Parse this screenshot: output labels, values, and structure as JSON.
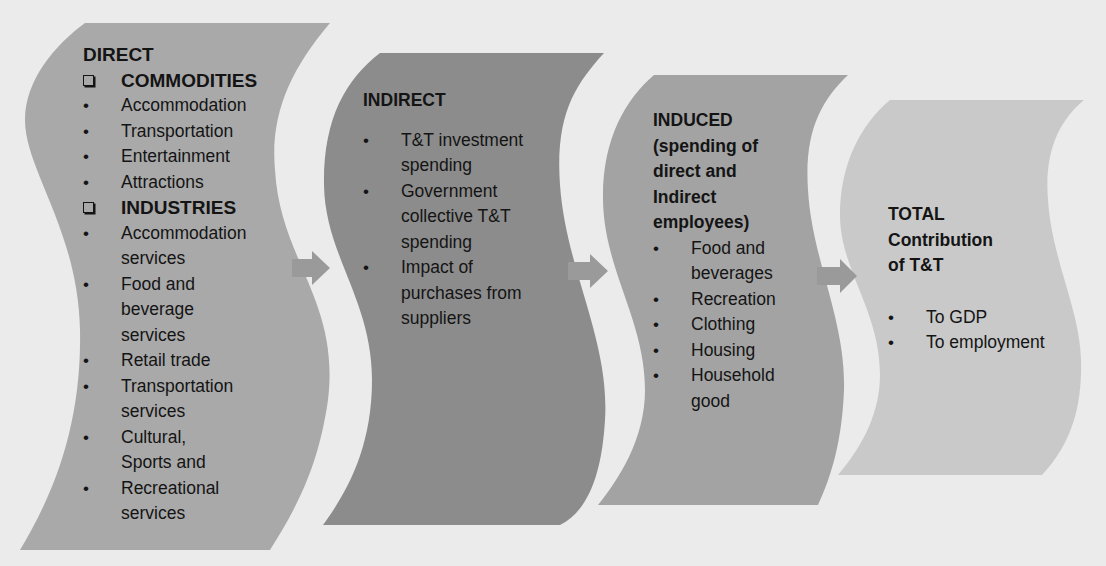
{
  "colors": {
    "background": "#ebebeb",
    "direct_fill": "#a9a9a9",
    "indirect_fill": "#8c8c8c",
    "induced_fill": "#a3a3a3",
    "total_fill": "#c9c9c9",
    "arrow_fill": "#9a9a9a",
    "text": "#141414"
  },
  "panels": {
    "direct": {
      "title": "DIRECT",
      "groups": [
        {
          "heading": "COMMODITIES",
          "icon": "checkbox-square-icon",
          "items": [
            "Accommodation",
            "Transportation",
            "Entertainment",
            "Attractions"
          ]
        },
        {
          "heading": "INDUSTRIES",
          "icon": "checkbox-square-icon",
          "items": [
            "Accommodation services",
            "Food and beverage services",
            "Retail trade",
            "Transportation services",
            "Cultural, Sports and",
            "Recreational services"
          ]
        }
      ]
    },
    "indirect": {
      "title": "INDIRECT",
      "items": [
        "T&T investment spending",
        "Government collective T&T spending",
        "Impact of purchases from suppliers"
      ]
    },
    "induced": {
      "title": "INDUCED (spending of direct and Indirect employees)",
      "items": [
        "Food and beverages",
        "Recreation",
        "Clothing",
        "Housing",
        "Household good"
      ]
    },
    "total": {
      "title": "TOTAL Contribution of T&T",
      "items": [
        "To GDP",
        "To employment"
      ]
    }
  },
  "bullet_glyph": "•",
  "arrows": [
    "arrow-direct-to-indirect",
    "arrow-indirect-to-induced",
    "arrow-induced-to-total"
  ]
}
